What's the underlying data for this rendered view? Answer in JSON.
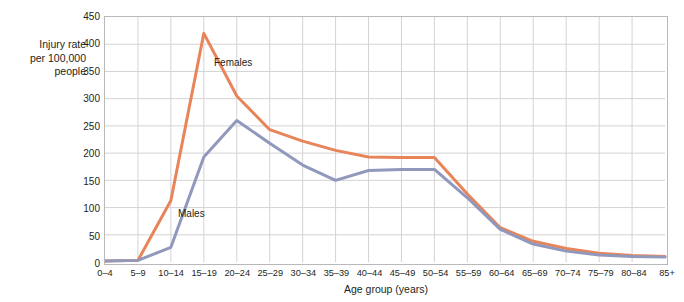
{
  "chart_data": {
    "type": "line",
    "title": "",
    "xlabel": "Age group (years)",
    "ylabel": "Injury rate\nper 100,000\npeople",
    "categories": [
      "0–4",
      "5–9",
      "10–14",
      "15–19",
      "20–24",
      "25–29",
      "30–34",
      "35–39",
      "40–44",
      "45–49",
      "50–54",
      "55–59",
      "60–64",
      "65–69",
      "70–74",
      "75–79",
      "80–84",
      "85+"
    ],
    "series": [
      {
        "name": "Females",
        "color": "#e8845a",
        "values": [
          2,
          3,
          113,
          420,
          305,
          243,
          222,
          205,
          193,
          192,
          192,
          125,
          63,
          38,
          25,
          16,
          12,
          10
        ]
      },
      {
        "name": "Males",
        "color": "#9098bc",
        "values": [
          2,
          3,
          27,
          193,
          260,
          218,
          178,
          150,
          168,
          170,
          170,
          118,
          60,
          33,
          20,
          13,
          10,
          9
        ]
      }
    ],
    "ylim": [
      0,
      450
    ],
    "yticks": [
      0,
      50,
      100,
      150,
      200,
      250,
      300,
      350,
      400,
      450
    ],
    "ytick_labels": [
      "0",
      "50",
      "100",
      "150",
      "200",
      "250",
      "300",
      "350",
      "400",
      "450"
    ],
    "grid": true,
    "grid_x": true,
    "grid_y": true,
    "legend_position": "inline-annotations",
    "annotations": [
      {
        "text": "Females",
        "series": "Females"
      },
      {
        "text": "Males",
        "series": "Males"
      }
    ]
  },
  "axes": {
    "y_title": "Injury rate\nper 100,000\npeople",
    "x_title": "Age group (years)"
  },
  "colors": {
    "females": "#e8845a",
    "males": "#9098bc",
    "grid": "#d3d3d3",
    "frame": "#b9b9b9",
    "text": "#231f20",
    "background": "#ffffff"
  }
}
